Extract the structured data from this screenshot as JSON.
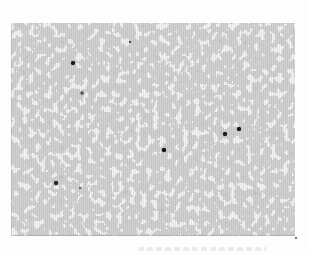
{
  "figure": {
    "type": "halftone-micrograph-photo",
    "alt": "Grainy gray halftone micrograph with scattered small dark particles on a white page",
    "page_background": "#fdfdfd",
    "image_area": {
      "left": 11,
      "top": 23,
      "width": 284,
      "height": 213
    },
    "palette": {
      "base_gray": "#a1a1a1",
      "light_blob_gray": "#e6e6e6",
      "dark_patch_gray": "#8f8f8f",
      "particle_black": "#141414"
    },
    "particles": [
      {
        "x": 73,
        "y": 63,
        "size": 4,
        "color": "#1c1c1c"
      },
      {
        "x": 82,
        "y": 93,
        "size": 3,
        "color": "#4f4f4f"
      },
      {
        "x": 130,
        "y": 42,
        "size": 2,
        "color": "#3c3c3c"
      },
      {
        "x": 164,
        "y": 150,
        "size": 4,
        "color": "#101010"
      },
      {
        "x": 225,
        "y": 134,
        "size": 4,
        "color": "#1a1a1a"
      },
      {
        "x": 239,
        "y": 129,
        "size": 4,
        "color": "#161616"
      },
      {
        "x": 56,
        "y": 183,
        "size": 4,
        "color": "#242424"
      },
      {
        "x": 80,
        "y": 188,
        "size": 2,
        "color": "#555555"
      },
      {
        "x": 296,
        "y": 238,
        "size": 2,
        "color": "#6f6f6f"
      }
    ],
    "ghost_marks": {
      "left": 138,
      "top": 247,
      "width": 128,
      "height": 4,
      "color": "#e2e2e2"
    }
  }
}
